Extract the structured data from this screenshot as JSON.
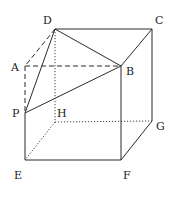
{
  "diagram": {
    "type": "cube-geometry",
    "vertices": [
      "A",
      "B",
      "C",
      "D",
      "E",
      "F",
      "G",
      "H",
      "P"
    ],
    "labels": {
      "A": "A",
      "B": "B",
      "C": "C",
      "D": "D",
      "E": "E",
      "F": "F",
      "G": "G",
      "H": "H",
      "P": "P"
    },
    "edges": [
      {
        "from": "D",
        "to": "C",
        "style": "solid"
      },
      {
        "from": "C",
        "to": "B",
        "style": "solid"
      },
      {
        "from": "C",
        "to": "G",
        "style": "solid"
      },
      {
        "from": "B",
        "to": "F",
        "style": "solid"
      },
      {
        "from": "E",
        "to": "F",
        "style": "solid"
      },
      {
        "from": "F",
        "to": "G",
        "style": "solid"
      },
      {
        "from": "P",
        "to": "E",
        "style": "solid"
      },
      {
        "from": "D",
        "to": "A",
        "style": "dashed"
      },
      {
        "from": "A",
        "to": "B",
        "style": "dashed"
      },
      {
        "from": "A",
        "to": "P",
        "style": "dashed"
      },
      {
        "from": "D",
        "to": "H",
        "style": "dotted"
      },
      {
        "from": "H",
        "to": "G",
        "style": "dotted"
      },
      {
        "from": "H",
        "to": "E",
        "style": "dotted"
      },
      {
        "from": "D",
        "to": "B",
        "style": "solid"
      },
      {
        "from": "D",
        "to": "P",
        "style": "solid"
      },
      {
        "from": "P",
        "to": "B",
        "style": "solid"
      }
    ]
  }
}
